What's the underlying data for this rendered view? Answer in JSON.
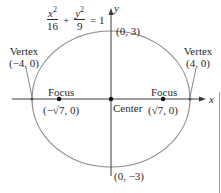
{
  "diagram": {
    "type": "ellipse",
    "equation": {
      "term1": {
        "numerator_var": "x",
        "numerator_exp": "2",
        "denominator": "16"
      },
      "plus": "+",
      "term2": {
        "numerator_var": "y",
        "numerator_exp": "2",
        "denominator": "9"
      },
      "equals": "= 1"
    },
    "axes": {
      "x_label": "x",
      "y_label": "y"
    },
    "points": {
      "top": "(0, 3)",
      "bottom": "(0, −3)",
      "center": "Center",
      "left_vertex": {
        "title": "Vertex",
        "coords": "(−4, 0)"
      },
      "right_vertex": {
        "title": "Vertex",
        "coords": "(4, 0)"
      },
      "left_focus": {
        "title": "Focus",
        "coords": "(−√7, 0)"
      },
      "right_focus": {
        "title": "Focus",
        "coords": "(√7, 0)"
      }
    },
    "colors": {
      "ellipse": "#8a8a8a",
      "axes": "#3a3a3a",
      "points": "#111111",
      "text": "#2a2a2a"
    }
  }
}
